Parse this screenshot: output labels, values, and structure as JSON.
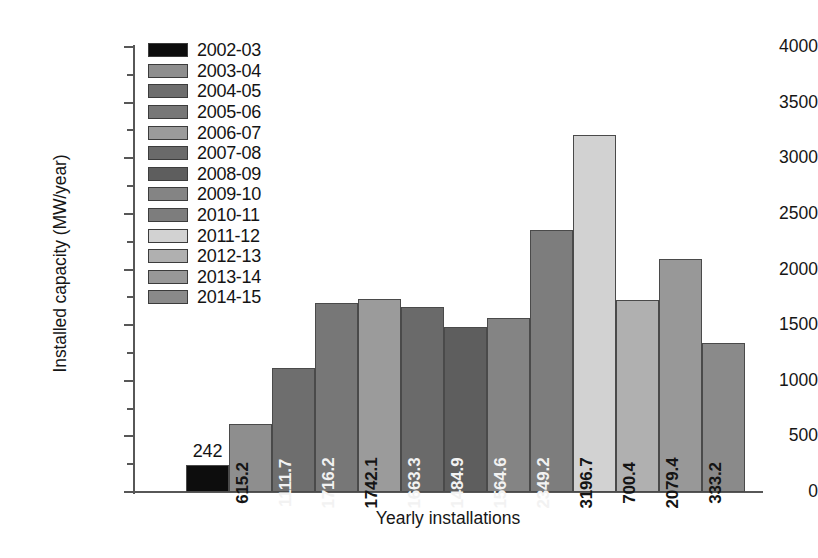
{
  "chart_data": {
    "type": "bar",
    "title": "",
    "xlabel": "Yearly installations",
    "ylabel": "Installed capacity (MW/year)",
    "ylim": [
      0,
      4000
    ],
    "ytick_step": 500,
    "yminor_step": 250,
    "yticks": [
      "0",
      "500",
      "1000",
      "1500",
      "2000",
      "2500",
      "3000",
      "3500",
      "4000"
    ],
    "grid": false,
    "legend_position": "upper-left",
    "xtick_labels": [],
    "categories": [
      "2002-03",
      "2003-04",
      "2004-05",
      "2005-06",
      "2006-07",
      "2007-08",
      "2008-09",
      "2009-10",
      "2010-11",
      "2011-12",
      "2012-13",
      "2013-14",
      "2014-15"
    ],
    "values": [
      242,
      615.2,
      1111.7,
      1716.2,
      1742.1,
      1663.3,
      1484.9,
      1564.6,
      2349.2,
      3196.7,
      1716.0,
      2079.4,
      1345.0
    ],
    "data_labels": [
      "242",
      "615.2",
      "1111.7",
      "1716.2",
      "1742.1",
      "1663.3",
      "1484.9",
      "1564.6",
      "2349.2",
      "3196.7",
      "700.4",
      "2079.4",
      "333.2"
    ],
    "bar_heights_mw": [
      242,
      611,
      1115,
      1700,
      1736,
      1664,
      1484,
      1565,
      2356,
      3208,
      1727,
      2092,
      1340
    ],
    "bar_colors": [
      "#0d0d0d",
      "#8e8e8e",
      "#6e6e6e",
      "#777777",
      "#9b9b9b",
      "#6a6a6a",
      "#5e5e5e",
      "#848484",
      "#7d7d7d",
      "#d2d2d2",
      "#b0b0b0",
      "#989898",
      "#8a8a8a"
    ],
    "label_contrast": [
      "outside",
      "dark",
      "light",
      "light",
      "light",
      "light",
      "light",
      "light",
      "light",
      "light",
      "light",
      "light",
      "light"
    ]
  },
  "axis": {
    "y_title": "Installed capacity (MW/year)",
    "x_title": "Yearly installations"
  },
  "legend": {
    "items": [
      {
        "label": "2002-03",
        "color": "#0d0d0d"
      },
      {
        "label": "2003-04",
        "color": "#8e8e8e"
      },
      {
        "label": "2004-05",
        "color": "#6e6e6e"
      },
      {
        "label": "2005-06",
        "color": "#777777"
      },
      {
        "label": "2006-07",
        "color": "#9b9b9b"
      },
      {
        "label": "2007-08",
        "color": "#6a6a6a"
      },
      {
        "label": "2008-09",
        "color": "#5e5e5e"
      },
      {
        "label": "2009-10",
        "color": "#848484"
      },
      {
        "label": "2010-11",
        "color": "#7d7d7d"
      },
      {
        "label": "2011-12",
        "color": "#d2d2d2"
      },
      {
        "label": "2012-13",
        "color": "#b0b0b0"
      },
      {
        "label": "2013-14",
        "color": "#989898"
      },
      {
        "label": "2014-15",
        "color": "#8a8a8a"
      }
    ]
  }
}
